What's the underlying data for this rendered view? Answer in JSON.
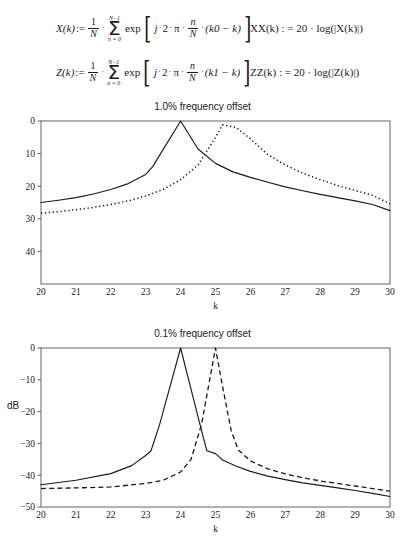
{
  "formulas": {
    "x_def": {
      "lhs": "X(k)",
      "assign": ":=",
      "frac_num": "1",
      "frac_den": "N",
      "sum_upper": "N−1",
      "sum_lower": "n = 0",
      "exp": "exp",
      "arg_j": "j",
      "arg_two": "2",
      "arg_pi": "π",
      "arg_frac_num": "n",
      "arg_frac_den": "N",
      "arg_tail": "(k0 − k)"
    },
    "z_def": {
      "lhs": "Z(k)",
      "assign": ":=",
      "frac_num": "1",
      "frac_den": "N",
      "sum_upper": "N−1",
      "sum_lower": "n = 0",
      "exp": "exp",
      "arg_j": "j",
      "arg_two": "2",
      "arg_pi": "π",
      "arg_frac_num": "n",
      "arg_frac_den": "N",
      "arg_tail": "(k1 − k)"
    },
    "xx_def": "XX(k) : = 20 · log(|X(k)|)",
    "zz_def": "ZZ(k) : = 20 · log(|Z(k)|)"
  },
  "chart_data": [
    {
      "id": "chart-1",
      "type": "line",
      "title": "1.0% frequency offset",
      "xlabel": "k",
      "ylabel": "",
      "xlim": [
        20,
        30
      ],
      "ylim": [
        50,
        0
      ],
      "grid": false,
      "legend": "none",
      "xticks": [
        20,
        21,
        22,
        23,
        24,
        25,
        26,
        27,
        28,
        29,
        30
      ],
      "xticklabels": [
        "20",
        "21",
        "22",
        "23",
        "24",
        "25",
        "26",
        "27",
        "28",
        "29",
        "30"
      ],
      "yticks": [
        0,
        10,
        20,
        30,
        40
      ],
      "yticklabels": [
        "0",
        "10",
        "20",
        "30",
        "40"
      ],
      "y_axis_note": "labels are positive magnitudes of negative dB; axis increases downward",
      "series": [
        {
          "name": "XX(k)",
          "style": "solid",
          "x": [
            20,
            20.5,
            21,
            21.5,
            22,
            22.5,
            23,
            23.2,
            24,
            24.5,
            25,
            25.5,
            26,
            26.5,
            27,
            27.5,
            28,
            28.5,
            29,
            29.5,
            30
          ],
          "values": [
            25.0,
            24.3,
            23.5,
            22.4,
            21.0,
            19.2,
            16.4,
            14.0,
            0.0,
            8.6,
            13.0,
            15.6,
            17.3,
            18.8,
            20.2,
            21.4,
            22.5,
            23.5,
            24.5,
            25.6,
            27.5
          ]
        },
        {
          "name": "ZZ(k)",
          "style": "dotted",
          "x": [
            20,
            20.5,
            21,
            21.5,
            22,
            22.5,
            23,
            23.5,
            24,
            24.5,
            25,
            25.2,
            25.6,
            26,
            26.5,
            27,
            27.5,
            28,
            28.5,
            29,
            29.5,
            30
          ],
          "values": [
            28.3,
            27.8,
            27.2,
            26.5,
            25.6,
            24.5,
            23.0,
            21.0,
            18.0,
            13.5,
            5.0,
            1.2,
            2.0,
            5.5,
            10.3,
            13.5,
            16.0,
            18.0,
            19.8,
            21.3,
            22.8,
            25.4
          ]
        }
      ]
    },
    {
      "id": "chart-2",
      "type": "line",
      "title": "0.1% frequency offset",
      "xlabel": "k",
      "ylabel": "dB",
      "xlim": [
        20,
        30
      ],
      "ylim": [
        -50,
        0
      ],
      "grid": false,
      "legend": "none",
      "xticks": [
        20,
        21,
        22,
        23,
        24,
        25,
        26,
        27,
        28,
        29,
        30
      ],
      "xticklabels": [
        "20",
        "21",
        "22",
        "23",
        "24",
        "25",
        "26",
        "27",
        "28",
        "29",
        "30"
      ],
      "yticks": [
        0,
        -10,
        -20,
        -30,
        -40,
        -50
      ],
      "yticklabels": [
        "0",
        "−10",
        "−20",
        "−30",
        "−40",
        "−50"
      ],
      "series": [
        {
          "name": "XX(k)",
          "style": "solid",
          "x": [
            20,
            21,
            22,
            22.6,
            23,
            23.15,
            23.4,
            23.7,
            24,
            24.3,
            24.6,
            24.75,
            25,
            25.2,
            25.6,
            26,
            26.5,
            27,
            27.5,
            28,
            28.5,
            29,
            29.5,
            30
          ],
          "values": [
            -43.0,
            -41.6,
            -39.5,
            -37.0,
            -33.8,
            -32.4,
            -24.0,
            -12.0,
            0.0,
            -13.0,
            -26.0,
            -32.3,
            -33.2,
            -35.2,
            -37.2,
            -38.8,
            -40.3,
            -41.4,
            -42.4,
            -43.2,
            -44.0,
            -44.8,
            -45.7,
            -46.7
          ]
        },
        {
          "name": "ZZ(k)",
          "style": "dashed",
          "x": [
            20,
            21,
            22,
            23,
            23.5,
            24,
            24.3,
            24.6,
            24.85,
            25,
            25.2,
            25.45,
            25.65,
            26,
            26.5,
            27,
            27.5,
            28,
            28.5,
            29,
            29.5,
            30
          ],
          "values": [
            -44.2,
            -44.0,
            -43.7,
            -42.6,
            -41.6,
            -39.0,
            -35.0,
            -24.0,
            -9.0,
            0.0,
            -12.0,
            -26.0,
            -32.0,
            -35.5,
            -38.0,
            -39.6,
            -40.8,
            -41.8,
            -42.6,
            -43.4,
            -44.2,
            -45.0
          ]
        }
      ]
    }
  ]
}
